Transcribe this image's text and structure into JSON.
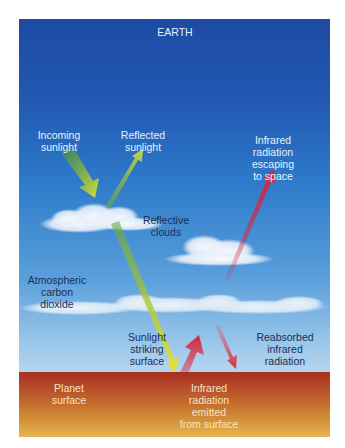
{
  "title": "EARTH",
  "labels": {
    "incoming_sunlight": "Incoming\nsunlight",
    "reflected_sunlight": "Reflected\nsunlight",
    "infrared_escaping": "Infrared\nradiation\nescaping\nto space",
    "reflective_clouds": "Reflective\nclouds",
    "atmospheric_co2": "Atmospheric\ncarbon\ndioxide",
    "sunlight_striking": "Sunlight\nstriking\nsurface",
    "reabsorbed_infrared": "Reabsorbed\ninfrared\nradiation",
    "planet_surface": "Planet\nsurface",
    "infrared_emitted": "Infrared\nradiation\nemitted\nfrom surface"
  },
  "colors": {
    "sky_top": "#1e4ba3",
    "sky_bottom": "#c4dcef",
    "surface_top": "#a8301c",
    "surface_bottom": "#e6b553",
    "sunlight_arrow": "#c8d63a",
    "infrared_arrow": "#d9253a"
  }
}
